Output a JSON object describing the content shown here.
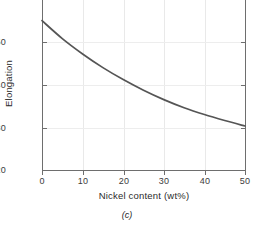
{
  "chart_data": {
    "type": "line",
    "title": "",
    "subtitle": "",
    "caption": "(c)",
    "xlabel": "Nickel content (wt%)",
    "ylabel": "Elongation",
    "xlim": [
      0,
      50
    ],
    "ylim": [
      20,
      60
    ],
    "xticks": [
      0,
      10,
      20,
      30,
      40,
      50
    ],
    "xtick_labels": [
      "0",
      "10",
      "20",
      "30",
      "40",
      "50"
    ],
    "yticks": [
      20,
      30,
      40,
      50
    ],
    "ytick_labels": [
      "20",
      "30",
      "40",
      "50"
    ],
    "grid": "both-faint",
    "legend": "none",
    "series": [
      {
        "name": "Elongation",
        "color": "#555555",
        "x": [
          0,
          5,
          10,
          15,
          20,
          25,
          30,
          35,
          40,
          45,
          50
        ],
        "values": [
          55.0,
          50.8,
          47.2,
          44.0,
          41.2,
          38.7,
          36.5,
          34.6,
          33.0,
          31.6,
          30.3
        ]
      }
    ]
  }
}
